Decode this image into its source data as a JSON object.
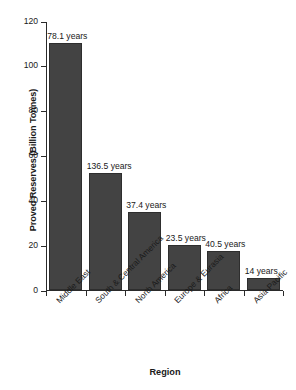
{
  "chart_data": {
    "type": "bar",
    "title": "",
    "xlabel": "Region",
    "ylabel": "Proved Reserves (Billion Tonnes)",
    "categories": [
      "Middle East",
      "South & Central America",
      "North America",
      "Europe & Eurasia",
      "Africa",
      "Asia-Pacific"
    ],
    "values": [
      110,
      52,
      35,
      20,
      17.5,
      5.5
    ],
    "annotations": [
      "78.1 years",
      "136.5 years",
      "37.4 years",
      "23.5 years",
      "40.5 years",
      "14 years"
    ],
    "ylim": [
      0,
      120
    ],
    "yticks": [
      0,
      20,
      40,
      60,
      80,
      100,
      120
    ],
    "ytick_labels": [
      "0",
      "20",
      "40",
      "60",
      "80",
      "100",
      "120"
    ],
    "grid": false,
    "legend": "none",
    "bar_color": "#434343",
    "axis_color": "#2a2a2a",
    "background": "#ffffff"
  }
}
